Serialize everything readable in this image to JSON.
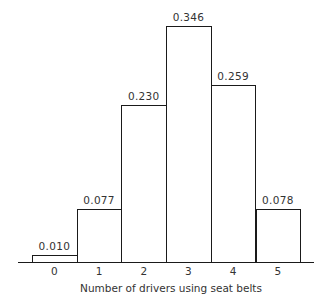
{
  "chart_data": {
    "type": "bar",
    "title": "",
    "xlabel": "Number of drivers using seat belts",
    "ylabel": "",
    "categories": [
      "0",
      "1",
      "2",
      "3",
      "4",
      "5"
    ],
    "values": [
      0.01,
      0.077,
      0.23,
      0.346,
      0.259,
      0.078
    ],
    "value_labels": [
      "0.010",
      "0.077",
      "0.230",
      "0.346",
      "0.259",
      "0.078"
    ],
    "ylim": [
      0,
      0.35
    ],
    "grid": false,
    "legend": null,
    "bar_style": "outlined histogram, adjacent bars"
  }
}
